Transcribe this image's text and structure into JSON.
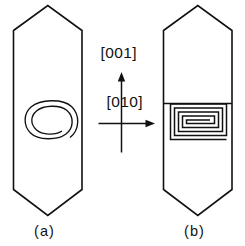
{
  "figure": {
    "background_color": "#ffffff",
    "line_color": "#111111",
    "panels": [
      {
        "caption": "(a)",
        "crystal_shape": "hexagonal-prism-pointed-ends",
        "spiral_type": "rounded-oval-spiral",
        "spiral_turns": 3,
        "has_ledge_line": false
      },
      {
        "caption": "(b)",
        "crystal_shape": "hexagonal-prism-pointed-ends",
        "spiral_type": "rectangular-spiral",
        "spiral_turns": 3,
        "has_ledge_line": true
      }
    ],
    "axes": {
      "vertical_label": "[001]",
      "horizontal_label": "[010]",
      "vertical_direction": "up",
      "horizontal_direction": "right"
    },
    "captions": {
      "left": "(a)",
      "right": "(b)"
    }
  }
}
